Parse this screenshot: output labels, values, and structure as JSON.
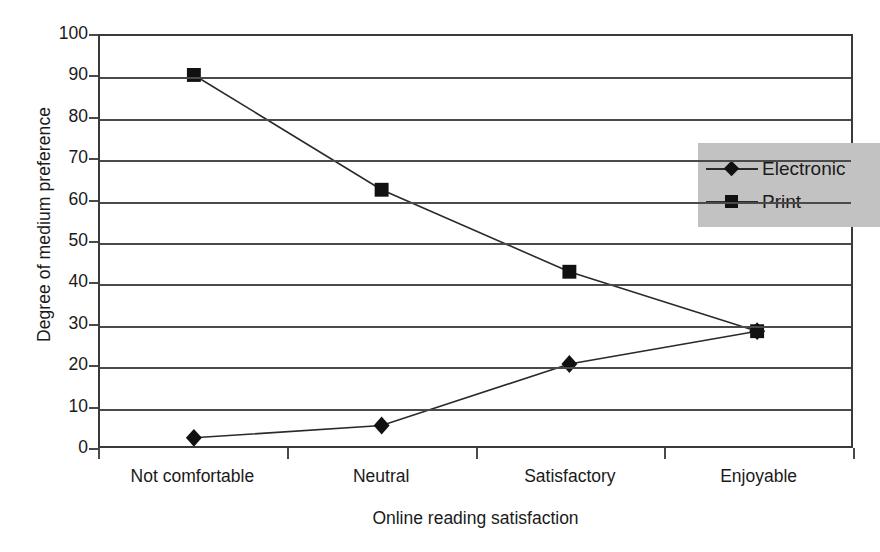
{
  "chart_data": {
    "type": "line",
    "title": "",
    "xlabel": "Online reading satisfaction",
    "ylabel": "Degree of medium preference",
    "categories": [
      "Not comfortable",
      "Neutral",
      "Satisfactory",
      "Enjoyable"
    ],
    "series": [
      {
        "name": "Electronic",
        "marker": "diamond",
        "values": [
          2,
          5,
          20,
          28
        ]
      },
      {
        "name": "Print",
        "marker": "square",
        "values": [
          90.5,
          62.5,
          42.5,
          28
        ]
      }
    ],
    "ylim": [
      0,
      100
    ],
    "yticks": [
      0,
      10,
      20,
      30,
      40,
      50,
      60,
      70,
      80,
      90,
      100
    ],
    "ytick_labels": [
      "0",
      "10",
      "20",
      "30",
      "40",
      "50",
      "60",
      "70",
      "80",
      "90",
      "100"
    ],
    "grid": "horizontal",
    "legend_position": "upper-right-inside",
    "colors": {
      "line": "#2a2a2a",
      "marker": "#111111",
      "grid": "#4a4a4a",
      "axis": "#3a3a3a",
      "legend_background": "#c2c2c2",
      "plot_background": "#ffffff",
      "text": "#1a1a1a"
    }
  }
}
